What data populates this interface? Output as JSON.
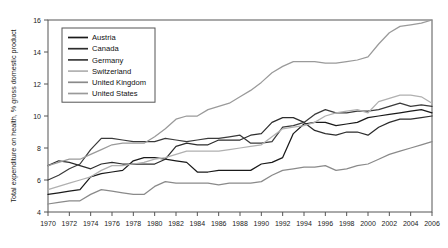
{
  "chart_data": {
    "type": "line",
    "title": "",
    "xlabel": "",
    "ylabel": "Total expenditure on health, % gross domestic product",
    "xlim": [
      1970,
      2006
    ],
    "ylim": [
      4,
      16
    ],
    "yticks": [
      4,
      6,
      8,
      10,
      12,
      14,
      16
    ],
    "xticks": [
      1970,
      1972,
      1974,
      1976,
      1978,
      1980,
      1982,
      1984,
      1986,
      1988,
      1990,
      1992,
      1994,
      1996,
      1998,
      2000,
      2002,
      2004,
      2006
    ],
    "grid": false,
    "legend_position": "top-left",
    "x": [
      1970,
      1971,
      1972,
      1973,
      1974,
      1975,
      1976,
      1977,
      1978,
      1979,
      1980,
      1981,
      1982,
      1983,
      1984,
      1985,
      1986,
      1987,
      1988,
      1989,
      1990,
      1991,
      1992,
      1993,
      1994,
      1995,
      1996,
      1997,
      1998,
      1999,
      2000,
      2001,
      2002,
      2003,
      2004,
      2005,
      2006
    ],
    "series": [
      {
        "name": "Austria",
        "color": "#1a1a1a",
        "values": [
          5.1,
          5.2,
          5.3,
          5.4,
          6.2,
          6.4,
          6.5,
          6.6,
          7.2,
          7.4,
          7.4,
          7.3,
          7.2,
          7.1,
          6.5,
          6.5,
          6.6,
          6.6,
          6.6,
          6.6,
          7.0,
          7.1,
          7.4,
          8.9,
          9.5,
          9.6,
          9.6,
          9.4,
          9.5,
          9.6,
          9.9,
          10.0,
          10.1,
          10.2,
          10.3,
          10.4,
          10.2
        ]
      },
      {
        "name": "Canada",
        "color": "#2d2d2d",
        "values": [
          6.9,
          7.2,
          7.1,
          6.9,
          6.7,
          7.0,
          7.1,
          7.0,
          7.0,
          7.0,
          7.0,
          7.3,
          8.1,
          8.3,
          8.2,
          8.2,
          8.5,
          8.5,
          8.5,
          8.8,
          8.9,
          9.6,
          9.9,
          9.9,
          9.6,
          9.1,
          8.9,
          8.8,
          9.0,
          9.0,
          8.8,
          9.3,
          9.6,
          9.8,
          9.8,
          9.9,
          10.0
        ]
      },
      {
        "name": "Germany",
        "color": "#3a3a3a",
        "values": [
          6.0,
          6.3,
          6.7,
          7.0,
          7.9,
          8.6,
          8.6,
          8.5,
          8.4,
          8.4,
          8.4,
          8.6,
          8.5,
          8.4,
          8.5,
          8.6,
          8.6,
          8.7,
          8.8,
          8.3,
          8.3,
          8.4,
          9.3,
          9.4,
          9.6,
          10.1,
          10.4,
          10.2,
          10.2,
          10.3,
          10.3,
          10.4,
          10.6,
          10.8,
          10.6,
          10.7,
          10.6
        ]
      },
      {
        "name": "Switzerland",
        "color": "#b0b0b0",
        "values": [
          5.4,
          5.6,
          5.8,
          6.0,
          6.2,
          6.6,
          6.9,
          6.9,
          7.0,
          7.1,
          7.3,
          7.4,
          7.6,
          7.8,
          7.8,
          7.8,
          7.8,
          7.9,
          8.0,
          8.1,
          8.2,
          8.7,
          9.2,
          9.3,
          9.4,
          9.6,
          10.0,
          10.2,
          10.3,
          10.4,
          10.2,
          10.9,
          11.1,
          11.3,
          11.3,
          11.2,
          10.8
        ]
      },
      {
        "name": "United Kingdom",
        "color": "#8a8a8a",
        "values": [
          4.5,
          4.6,
          4.7,
          4.7,
          5.1,
          5.4,
          5.3,
          5.2,
          5.1,
          5.1,
          5.6,
          5.9,
          5.8,
          5.8,
          5.8,
          5.8,
          5.7,
          5.8,
          5.8,
          5.8,
          5.9,
          6.3,
          6.6,
          6.7,
          6.8,
          6.8,
          6.9,
          6.6,
          6.7,
          6.9,
          7.0,
          7.3,
          7.6,
          7.8,
          8.0,
          8.2,
          8.4
        ]
      },
      {
        "name": "United States",
        "color": "#9a9a9a",
        "values": [
          6.9,
          7.1,
          7.3,
          7.3,
          7.6,
          7.9,
          8.2,
          8.3,
          8.3,
          8.3,
          8.7,
          9.2,
          9.8,
          10.0,
          10.0,
          10.4,
          10.6,
          10.8,
          11.2,
          11.6,
          12.1,
          12.7,
          13.1,
          13.4,
          13.4,
          13.4,
          13.3,
          13.3,
          13.4,
          13.5,
          13.7,
          14.5,
          15.2,
          15.6,
          15.7,
          15.8,
          16.0
        ]
      }
    ]
  },
  "legend": {
    "items": [
      {
        "label": "Austria"
      },
      {
        "label": "Canada"
      },
      {
        "label": "Germany"
      },
      {
        "label": "Switzerland"
      },
      {
        "label": "United Kingdom"
      },
      {
        "label": "United States"
      }
    ]
  }
}
